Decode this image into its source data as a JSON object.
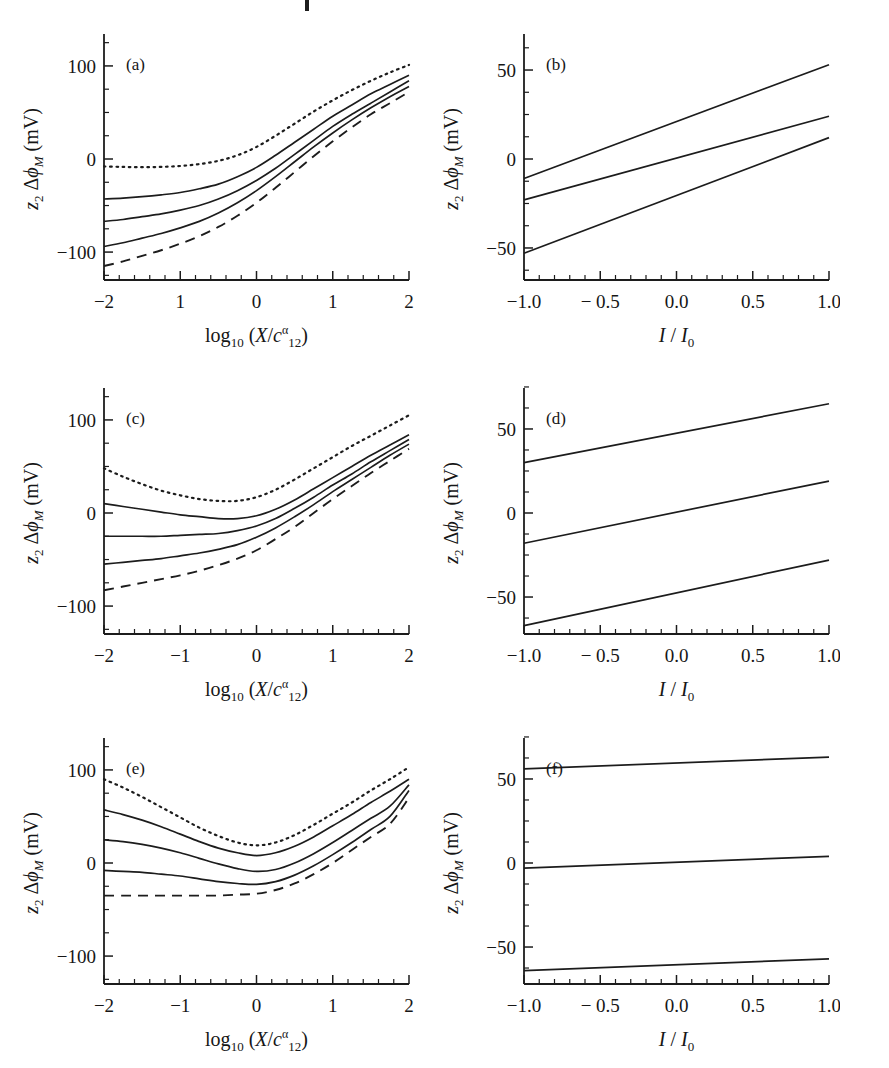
{
  "figure": {
    "type": "multi-panel-line-figure",
    "panel_count": 6,
    "columns": 2,
    "rows": 3
  },
  "axis_text": {
    "y_label_parts": {
      "z": "z",
      "z_sub": "2",
      "delta": "Δ",
      "phi": "ϕ",
      "phi_sub": "M",
      "units": "(mV)"
    },
    "x_label_left_parts": {
      "log": "log",
      "log_sub": "10",
      "open": "(",
      "X": "X",
      "slash": "/",
      "c": "c",
      "c_sub": "12",
      "c_sup": "α",
      "close": ")"
    },
    "x_label_right_parts": {
      "I": "I",
      "slash": "/",
      "I2": "I",
      "I2_sub": "0"
    }
  },
  "chart_data": [
    {
      "id": "a",
      "type": "line",
      "panel_label": "(a)",
      "title": "",
      "xlabel": "log10(X/c12^alpha)",
      "ylabel": "z2 dphi_M (mV)",
      "xlim": [
        -2,
        2
      ],
      "ylim": [
        -130,
        130
      ],
      "xticks": [
        -2,
        -1,
        0,
        1,
        2
      ],
      "xticklabels": [
        "−2",
        "1",
        "0",
        "1",
        "2"
      ],
      "yticks": [
        -100,
        0,
        100
      ],
      "yticklabels": [
        "−100",
        "0",
        "100"
      ],
      "grid": false,
      "legend": "none",
      "x": [
        -2,
        -1.75,
        -1.5,
        -1.25,
        -1,
        -0.75,
        -0.5,
        -0.25,
        0,
        0.25,
        0.5,
        0.75,
        1,
        1.25,
        1.5,
        1.75,
        2
      ],
      "series": [
        {
          "name": "dotted-upper",
          "style": "dotted",
          "values": [
            -8,
            -8.5,
            -8.8,
            -8.5,
            -7.5,
            -5.5,
            -2,
            4,
            13,
            25,
            38,
            51,
            63,
            74,
            84,
            93,
            101
          ]
        },
        {
          "name": "solid-1",
          "style": "solid",
          "values": [
            -43,
            -42,
            -40.5,
            -38.5,
            -36,
            -32,
            -27,
            -19,
            -9,
            4,
            18,
            32,
            46,
            58,
            70,
            80,
            90
          ]
        },
        {
          "name": "solid-2",
          "style": "solid",
          "values": [
            -67,
            -65,
            -62,
            -59,
            -55,
            -50,
            -43,
            -34,
            -23,
            -10,
            5,
            20,
            35,
            48,
            60,
            72,
            84
          ]
        },
        {
          "name": "solid-3",
          "style": "solid",
          "values": [
            -94,
            -90,
            -85,
            -80,
            -74,
            -67,
            -58,
            -47,
            -34,
            -19,
            -3,
            13,
            28,
            42,
            55,
            67,
            78
          ]
        },
        {
          "name": "dashed-lower",
          "style": "dashed",
          "values": [
            -115,
            -110,
            -104,
            -98,
            -91,
            -83,
            -73,
            -61,
            -47,
            -31,
            -14,
            3,
            19,
            34,
            48,
            60,
            72
          ]
        }
      ]
    },
    {
      "id": "b",
      "type": "line",
      "panel_label": "(b)",
      "title": "",
      "xlabel": "I/I0",
      "ylabel": "z2 dphi_M (mV)",
      "xlim": [
        -1,
        1
      ],
      "ylim": [
        -68,
        68
      ],
      "xticks": [
        -1,
        -0.5,
        0,
        0.5,
        1
      ],
      "xticklabels": [
        "−1.0",
        "− 0.5",
        "0.0",
        "0.5",
        "1.0"
      ],
      "yticks": [
        -50,
        0,
        50
      ],
      "yticklabels": [
        "−50",
        "0",
        "50"
      ],
      "grid": false,
      "legend": "none",
      "x": [
        -1,
        1
      ],
      "series": [
        {
          "name": "line-top",
          "style": "solid",
          "values": [
            -11,
            53
          ]
        },
        {
          "name": "line-middle",
          "style": "solid",
          "values": [
            -23,
            24
          ]
        },
        {
          "name": "line-bottom",
          "style": "solid",
          "values": [
            -53,
            12
          ]
        }
      ]
    },
    {
      "id": "c",
      "type": "line",
      "panel_label": "(c)",
      "title": "",
      "xlabel": "log10(X/c12^alpha)",
      "ylabel": "z2 dphi_M (mV)",
      "xlim": [
        -2,
        2
      ],
      "ylim": [
        -130,
        130
      ],
      "xticks": [
        -2,
        -1,
        0,
        1,
        2
      ],
      "xticklabels": [
        "−2",
        "−1",
        "0",
        "1",
        "2"
      ],
      "yticks": [
        -100,
        0,
        100
      ],
      "yticklabels": [
        "−100",
        "0",
        "100"
      ],
      "grid": false,
      "legend": "none",
      "x": [
        -2,
        -1.75,
        -1.5,
        -1.25,
        -1,
        -0.75,
        -0.5,
        -0.25,
        0,
        0.25,
        0.5,
        0.75,
        1,
        1.25,
        1.5,
        1.75,
        2
      ],
      "series": [
        {
          "name": "dotted-upper",
          "style": "dotted",
          "values": [
            48,
            39,
            31,
            24,
            19,
            15,
            13,
            13,
            17,
            25,
            36,
            48,
            60,
            72,
            83,
            94,
            105
          ]
        },
        {
          "name": "solid-1",
          "style": "solid",
          "values": [
            10,
            7,
            4,
            1,
            -2,
            -4,
            -6,
            -6,
            -3,
            4,
            14,
            26,
            38,
            50,
            62,
            73,
            84
          ]
        },
        {
          "name": "solid-2",
          "style": "solid",
          "values": [
            -25,
            -25,
            -25,
            -25,
            -24,
            -23,
            -22,
            -19,
            -14,
            -6,
            5,
            17,
            30,
            42,
            55,
            67,
            79
          ]
        },
        {
          "name": "solid-3",
          "style": "solid",
          "values": [
            -55,
            -53,
            -51,
            -49,
            -46,
            -43,
            -39,
            -34,
            -26,
            -16,
            -4,
            9,
            23,
            36,
            49,
            62,
            74
          ]
        },
        {
          "name": "dashed-lower",
          "style": "dashed",
          "values": [
            -83,
            -79,
            -75,
            -71,
            -67,
            -62,
            -56,
            -49,
            -40,
            -28,
            -15,
            0,
            15,
            29,
            43,
            56,
            69
          ]
        }
      ]
    },
    {
      "id": "d",
      "type": "line",
      "panel_label": "(d)",
      "title": "",
      "xlabel": "I/I0",
      "ylabel": "z2 dphi_M (mV)",
      "xlim": [
        -1,
        1
      ],
      "ylim": [
        -72,
        72
      ],
      "xticks": [
        -1,
        -0.5,
        0,
        0.5,
        1
      ],
      "xticklabels": [
        "−1.0",
        "− 0.5",
        "0.0",
        "0.5",
        "1.0"
      ],
      "yticks": [
        -50,
        0,
        50
      ],
      "yticklabels": [
        "−50",
        "0",
        "50"
      ],
      "grid": false,
      "legend": "none",
      "x": [
        -1,
        1
      ],
      "series": [
        {
          "name": "line-top",
          "style": "solid",
          "values": [
            30,
            65
          ]
        },
        {
          "name": "line-middle",
          "style": "solid",
          "values": [
            -18,
            19
          ]
        },
        {
          "name": "line-bottom",
          "style": "solid",
          "values": [
            -67,
            -28
          ]
        }
      ]
    },
    {
      "id": "e",
      "type": "line",
      "panel_label": "(e)",
      "title": "",
      "xlabel": "log10(X/c12^alpha)",
      "ylabel": "z2 dphi_M (mV)",
      "xlim": [
        -2,
        2
      ],
      "ylim": [
        -130,
        130
      ],
      "xticks": [
        -2,
        -1,
        0,
        1,
        2
      ],
      "xticklabels": [
        "−2",
        "−1",
        "0",
        "1",
        "2"
      ],
      "yticks": [
        -100,
        0,
        100
      ],
      "yticklabels": [
        "−100",
        "0",
        "100"
      ],
      "grid": false,
      "legend": "none",
      "x": [
        -2,
        -1.75,
        -1.5,
        -1.25,
        -1,
        -0.75,
        -0.5,
        -0.25,
        0,
        0.25,
        0.5,
        0.75,
        1,
        1.25,
        1.5,
        1.75,
        2
      ],
      "series": [
        {
          "name": "dotted-upper",
          "style": "dotted",
          "values": [
            90,
            81,
            71,
            60,
            49,
            38,
            29,
            22,
            19,
            22,
            30,
            41,
            53,
            65,
            78,
            90,
            103
          ]
        },
        {
          "name": "solid-1",
          "style": "solid",
          "values": [
            57,
            52,
            46,
            39,
            31,
            23,
            16,
            11,
            8,
            11,
            18,
            28,
            40,
            52,
            65,
            77,
            90
          ]
        },
        {
          "name": "solid-2",
          "style": "solid",
          "values": [
            25,
            23,
            20,
            16,
            11,
            5,
            -1,
            -6,
            -9,
            -7,
            0,
            10,
            22,
            35,
            48,
            61,
            84
          ]
        },
        {
          "name": "solid-3",
          "style": "solid",
          "values": [
            -8,
            -9,
            -10,
            -12,
            -14,
            -17,
            -20,
            -22,
            -23,
            -20,
            -13,
            -3,
            9,
            22,
            36,
            50,
            78
          ]
        },
        {
          "name": "dashed-lower",
          "style": "dashed",
          "values": [
            -35,
            -35,
            -35,
            -35,
            -35,
            -35,
            -35,
            -34,
            -33,
            -29,
            -22,
            -12,
            0,
            14,
            28,
            42,
            70
          ]
        }
      ]
    },
    {
      "id": "f",
      "type": "line",
      "panel_label": "(f)",
      "title": "",
      "xlabel": "I/I0",
      "ylabel": "z2 dphi_M (mV)",
      "xlim": [
        -1,
        1
      ],
      "ylim": [
        -72,
        72
      ],
      "xticks": [
        -1,
        -0.5,
        0,
        0.5,
        1
      ],
      "xticklabels": [
        "−1.0",
        "− 0.5",
        "0.0",
        "0.5",
        "1.0"
      ],
      "yticks": [
        -50,
        0,
        50
      ],
      "yticklabels": [
        "−50",
        "0",
        "50"
      ],
      "grid": false,
      "legend": "none",
      "x": [
        -1,
        1
      ],
      "series": [
        {
          "name": "line-top",
          "style": "solid",
          "values": [
            56,
            63
          ]
        },
        {
          "name": "line-middle",
          "style": "solid",
          "values": [
            -3,
            4
          ]
        },
        {
          "name": "line-bottom",
          "style": "solid",
          "values": [
            -64,
            -57
          ]
        }
      ]
    }
  ],
  "colors": {
    "ink": "#1c1c1c",
    "background": "#ffffff"
  }
}
